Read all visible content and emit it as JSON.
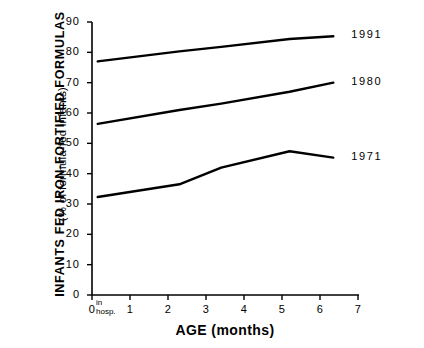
{
  "chart_data": {
    "type": "line",
    "title": "",
    "xlabel": "AGE  (months)",
    "ylabel": "INFANTS  FED  IRON-FORTIFIED  FORMULAS",
    "ylabel_sub": "(% of formula-fed infants)",
    "xlim": [
      0,
      7
    ],
    "ylim": [
      0,
      90
    ],
    "xticks": [
      0,
      1,
      2,
      3,
      4,
      5,
      6,
      7
    ],
    "xtick_labels": [
      "0",
      "1",
      "2",
      "3",
      "4",
      "5",
      "6",
      "7"
    ],
    "yticks": [
      0,
      10,
      20,
      30,
      40,
      50,
      60,
      70,
      80,
      90
    ],
    "ytick_labels": [
      "0",
      "10",
      "20",
      "30",
      "40",
      "50",
      "60",
      "70",
      "80",
      "90"
    ],
    "grid": false,
    "legend_position": "right-inline",
    "x_origin_annotation": "in\nhosp.",
    "x_origin_annotation_line1": "in",
    "x_origin_annotation_line2": "hosp.",
    "series": [
      {
        "name": "1991",
        "label": "1991",
        "color": "#000000",
        "points": [
          {
            "x": 0.15,
            "y": 77.0
          },
          {
            "x": 2.3,
            "y": 80.3
          },
          {
            "x": 3.4,
            "y": 81.8
          },
          {
            "x": 5.2,
            "y": 84.4
          },
          {
            "x": 6.35,
            "y": 85.3
          }
        ]
      },
      {
        "name": "1980",
        "label": "1980",
        "color": "#000000",
        "points": [
          {
            "x": 0.15,
            "y": 56.4
          },
          {
            "x": 2.3,
            "y": 61.0
          },
          {
            "x": 3.4,
            "y": 63.1
          },
          {
            "x": 5.2,
            "y": 67.0
          },
          {
            "x": 6.35,
            "y": 70.0
          }
        ]
      },
      {
        "name": "1971",
        "label": "1971",
        "color": "#000000",
        "points": [
          {
            "x": 0.15,
            "y": 32.3
          },
          {
            "x": 2.3,
            "y": 36.5
          },
          {
            "x": 3.4,
            "y": 42.0
          },
          {
            "x": 5.2,
            "y": 47.4
          },
          {
            "x": 6.35,
            "y": 45.3
          }
        ]
      }
    ]
  },
  "axes": {
    "ytick_labels": [
      "90",
      "80",
      "70",
      "60",
      "50",
      "40",
      "30",
      "20",
      "10",
      "0"
    ],
    "xtick_labels": [
      "0",
      "1",
      "2",
      "3",
      "4",
      "5",
      "6",
      "7"
    ]
  },
  "labels": {
    "y_title": "INFANTS  FED  IRON-FORTIFIED  FORMULAS",
    "y_subtitle": "(% of formula-fed infants)",
    "x_title": "AGE  (months)",
    "in_hosp_line1": "in",
    "in_hosp_line2": "hosp."
  },
  "series_labels": {
    "s1991": "1991",
    "s1980": "1980",
    "s1971": "1971"
  }
}
